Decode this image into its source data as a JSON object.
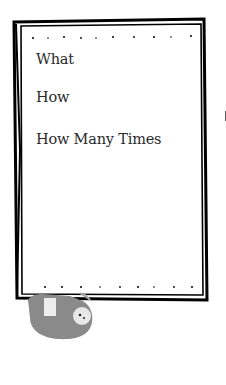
{
  "card": {
    "prompts": [
      {
        "label": "What"
      },
      {
        "label": "How"
      },
      {
        "label": "How Many Times"
      }
    ]
  },
  "decoration": {
    "illustration": "sloth hanging from branch",
    "border_color": "#000000",
    "sloth_color": "#8a8a8a"
  }
}
